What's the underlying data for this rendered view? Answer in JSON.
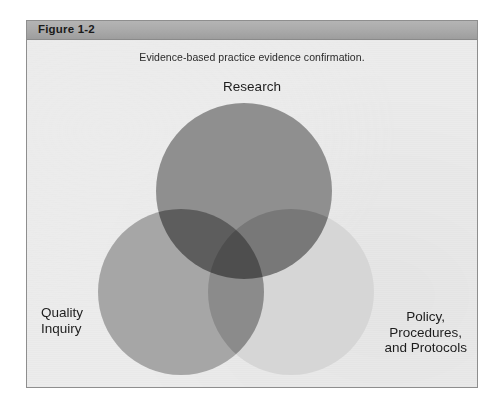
{
  "figure": {
    "header_label": "Figure 1-2",
    "caption": "Evidence-based practice evidence confirmation.",
    "border_color": "#8e8e8e",
    "panel_background": "#ececec",
    "header_background": "#a9a9a9"
  },
  "diagram": {
    "type": "venn-3-circle",
    "circles": [
      {
        "id": "research",
        "label": "Research",
        "position": "top",
        "color": "#8f8f8f"
      },
      {
        "id": "quality-inquiry",
        "label_line_1": "Quality",
        "label_line_2": "Inquiry",
        "position": "bottom-left",
        "color": "#a6a6a6"
      },
      {
        "id": "policy-procedures-protocols",
        "label_line_1": "Policy,",
        "label_line_2": "Procedures,",
        "label_line_3": "and Protocols",
        "position": "bottom-right",
        "color": "#d6d6d6"
      }
    ]
  }
}
